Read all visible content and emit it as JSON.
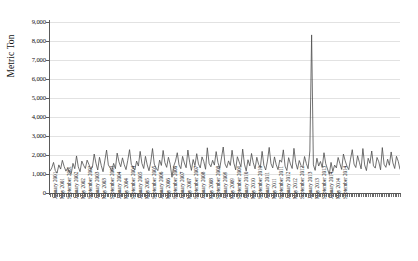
{
  "chart_data": {
    "type": "line",
    "title": "",
    "subtitle": "",
    "xlabel": "",
    "ylabel": "Metric Ton",
    "ylim": [
      0,
      9000
    ],
    "ytick_step": 1000,
    "ytick_labels": [
      "0",
      "1,000",
      "2,000",
      "3,000",
      "4,000",
      "5,000",
      "6,000",
      "7,000",
      "8,000",
      "9,000"
    ],
    "ytick_values": [
      0,
      1000,
      2000,
      3000,
      4000,
      5000,
      6000,
      7000,
      8000,
      9000
    ],
    "grid": true,
    "grid_axis": "y",
    "legend": false,
    "legend_position": "none",
    "line_color": "#4d4d4d",
    "grid_color": "#e2e2e2",
    "axis_color": "#5a5a5a",
    "x_start": "January 2001",
    "x_end": "December 2014",
    "x_frequency": "monthly",
    "xtick_labels": [
      "January 2001",
      "May 2001",
      "September 2001",
      "January 2002",
      "May 2002",
      "September 2002",
      "January 2003",
      "May 2003",
      "September 2003",
      "January 2004",
      "May 2004",
      "September 2004",
      "January 2005",
      "May 2005",
      "September 2005",
      "January 2006",
      "May 2006",
      "September 2006",
      "January 2007",
      "May 2007",
      "September 2007",
      "January 2008",
      "May 2008",
      "September 2008",
      "January 2009",
      "May 2009",
      "September 2009",
      "January 2010",
      "May 2010",
      "September 2010",
      "January 2011",
      "May 2011",
      "September 2011",
      "January 2012",
      "May 2012",
      "September 2012",
      "January 2013",
      "May 2013",
      "September 2013",
      "January 2014",
      "May 2014",
      "September 2014"
    ],
    "series": [
      {
        "name": "Metric Ton",
        "values": [
          1150,
          1320,
          1610,
          1180,
          1050,
          1480,
          1260,
          1720,
          1400,
          1150,
          1320,
          1080,
          1010,
          1560,
          1280,
          1950,
          1380,
          1120,
          1680,
          1460,
          1290,
          1730,
          1510,
          1240,
          1360,
          2050,
          1570,
          1210,
          1880,
          1450,
          1120,
          1690,
          2260,
          1480,
          1320,
          1170,
          1560,
          1280,
          2100,
          1640,
          1380,
          1850,
          1490,
          1230,
          1720,
          2280,
          1510,
          1340,
          1220,
          1680,
          1420,
          2190,
          1560,
          1290,
          1930,
          1480,
          1170,
          1640,
          2340,
          1520,
          1310,
          1180,
          1730,
          1450,
          2240,
          1600,
          1350,
          1880,
          1510,
          830,
          1420,
          1680,
          2120,
          1480,
          1280,
          1930,
          1580,
          1330,
          2260,
          1620,
          1190,
          1760,
          1440,
          2070,
          1530,
          1320,
          1900,
          1650,
          1250,
          2380,
          1560,
          1380,
          1720,
          1470,
          2180,
          1610,
          1290,
          1840,
          2420,
          1530,
          1330,
          1690,
          1450,
          2250,
          1580,
          1220,
          1910,
          1640,
          1380,
          2310,
          1520,
          1160,
          1750,
          1430,
          2080,
          1590,
          1270,
          1880,
          1510,
          1340,
          2190,
          1460,
          1210,
          1680,
          2400,
          1550,
          1320,
          1900,
          1480,
          1230,
          1740,
          1620,
          2270,
          1410,
          1180,
          1860,
          1530,
          1290,
          2350,
          1600,
          1250,
          1710,
          1450,
          1340,
          1920,
          1560,
          1280,
          2210,
          8320,
          1480,
          1190,
          1830,
          1420,
          1660,
          1350,
          2120,
          1540,
          1260,
          980,
          1610,
          1130,
          1470,
          1320,
          1870,
          1550,
          1240,
          2050,
          1690,
          1410,
          1230,
          1780,
          2280,
          1520,
          1340,
          1960,
          1620,
          1270,
          2340,
          1480,
          1180,
          1830,
          1560,
          2210,
          1430,
          1310,
          1870,
          1640,
          1220,
          2390,
          1510,
          1350,
          1780,
          1460,
          2160,
          1580,
          1290,
          1930,
          1670,
          1240
        ]
      }
    ],
    "annotations": [
      {
        "label": "peak",
        "x": "May 2011",
        "y": 8320
      }
    ]
  }
}
